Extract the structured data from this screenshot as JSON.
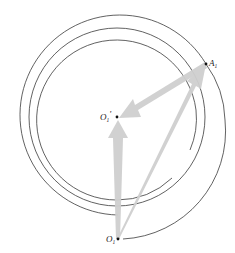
{
  "diagram": {
    "points": {
      "center": {
        "label": "O",
        "subscript": "1",
        "prime": "'",
        "x": 117,
        "y": 117
      },
      "outer_point": {
        "label": "A",
        "subscript": "1",
        "x": 206,
        "y": 64
      },
      "bottom_point": {
        "label": "O",
        "subscript": "1",
        "x": 118,
        "y": 239
      }
    },
    "arrows": [
      {
        "from": "bottom_point",
        "to": "center",
        "style": "thick-gray"
      },
      {
        "from": "bottom_point",
        "to": "outer_point",
        "style": "thick-gray"
      },
      {
        "from": "outer_point",
        "to": "center",
        "style": "thick-gray"
      }
    ],
    "colors": {
      "line": "#3a3a3a",
      "arrow": "#cfcfcf",
      "point": "#111111"
    }
  }
}
